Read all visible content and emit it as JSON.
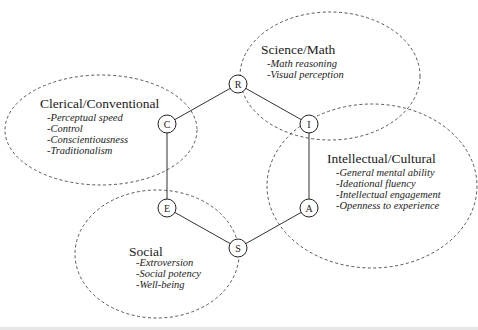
{
  "diagram": {
    "type": "hexagon-with-clusters",
    "nodes": [
      {
        "id": "R",
        "label": "R",
        "x": 238,
        "y": 84
      },
      {
        "id": "I",
        "label": "I",
        "x": 309,
        "y": 124
      },
      {
        "id": "A",
        "label": "A",
        "x": 309,
        "y": 208
      },
      {
        "id": "S",
        "label": "S",
        "x": 238,
        "y": 248
      },
      {
        "id": "E",
        "label": "E",
        "x": 167,
        "y": 208
      },
      {
        "id": "C",
        "label": "C",
        "x": 167,
        "y": 124
      }
    ],
    "edges": [
      [
        "R",
        "I"
      ],
      [
        "I",
        "A"
      ],
      [
        "A",
        "S"
      ],
      [
        "S",
        "E"
      ],
      [
        "E",
        "C"
      ],
      [
        "C",
        "R"
      ]
    ],
    "clusters": [
      {
        "name": "science-math",
        "title": "Science/Math",
        "items": [
          "-Math reasoning",
          "-Visual perception"
        ]
      },
      {
        "name": "clerical-conventional",
        "title": "Clerical/Conventional",
        "items": [
          "-Perceptual speed",
          "-Control",
          "-Conscientiousness",
          "-Traditionalism"
        ]
      },
      {
        "name": "intellectual-cultural",
        "title": "Intellectual/Cultural",
        "items": [
          "-General mental ability",
          "-Ideational fluency",
          "-Intellectual engagement",
          "-Openness to experience"
        ]
      },
      {
        "name": "social",
        "title": "Social",
        "items": [
          "-Extroversion",
          "-Social potency",
          "-Well-being"
        ]
      }
    ]
  }
}
